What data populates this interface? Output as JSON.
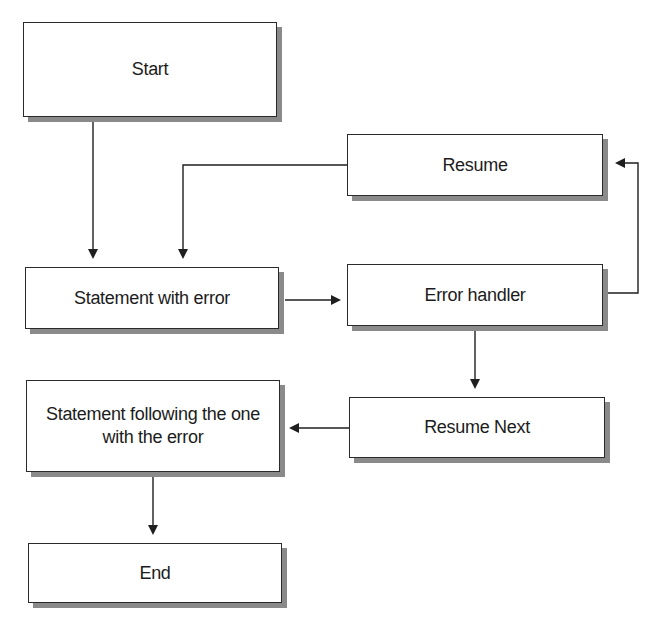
{
  "diagram": {
    "type": "flowchart",
    "caption": "Figure: Program flow with an error handler",
    "nodes": [
      {
        "id": "start",
        "label": "Start"
      },
      {
        "id": "resume",
        "label": "Resume"
      },
      {
        "id": "statement_with_error",
        "label": "Statement with error"
      },
      {
        "id": "error_handler",
        "label": "Error handler"
      },
      {
        "id": "statement_following",
        "label": "Statement following the one with the error"
      },
      {
        "id": "resume_next",
        "label": "Resume Next"
      },
      {
        "id": "end",
        "label": "End"
      }
    ],
    "edges": [
      {
        "from": "start",
        "to": "statement_with_error"
      },
      {
        "from": "resume",
        "to": "statement_with_error"
      },
      {
        "from": "statement_with_error",
        "to": "error_handler"
      },
      {
        "from": "error_handler",
        "to": "resume"
      },
      {
        "from": "error_handler",
        "to": "resume_next"
      },
      {
        "from": "resume_next",
        "to": "statement_following"
      },
      {
        "from": "statement_following",
        "to": "end"
      }
    ],
    "colors": {
      "line": "#1f1f1f",
      "box_border": "#2a2a2a",
      "shadow": "#8a8a8a",
      "background": "#ffffff"
    }
  }
}
